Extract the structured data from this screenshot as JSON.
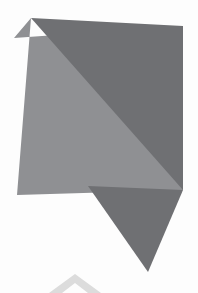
{
  "artwork": {
    "title": "Abstract Geometric Composition",
    "canvas": {
      "width": 198,
      "height": 293,
      "background_color": "#fdfdfd"
    },
    "palette": {
      "background": "#fdfdfd",
      "light_gray": "#8f9093",
      "dark_gray": "#6f7073",
      "faint_gray": "#dcdcdc"
    },
    "shapes": [
      {
        "name": "light-quadrilateral",
        "role": "base body panel",
        "fill": "#8f9093",
        "points": "31,18 14,38 183,26 183,190 17,195"
      },
      {
        "name": "dark-triangle",
        "role": "overlay wedge from top apex to lower right",
        "fill": "#6f7073",
        "points": "31,18 183,26 183,190"
      },
      {
        "name": "bottom-spike",
        "role": "downward pointing triangle below body",
        "fill": "#6f7073",
        "points": "88,186 183,190 148,272"
      },
      {
        "name": "faint-chevron",
        "role": "pale arrow mark at bottom edge",
        "fill": "#dcdcdc",
        "points": "75,274 101,293 88,293 75,283 62,293 49,293"
      }
    ]
  }
}
